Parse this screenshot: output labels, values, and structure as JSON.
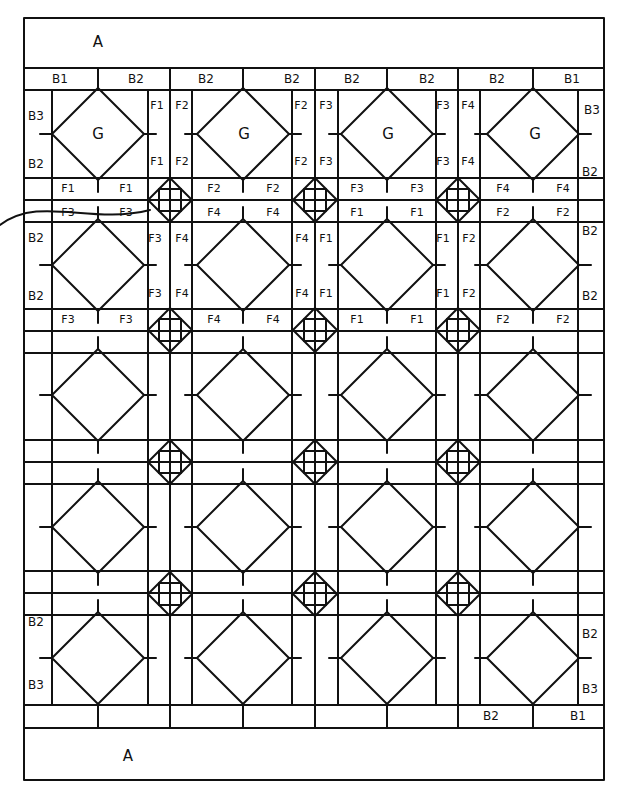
{
  "diagram": {
    "stroke_color": "#111111",
    "background": "#ffffff",
    "outer_border": {
      "x": 24,
      "y": 18,
      "w": 580,
      "h": 762
    },
    "h_lines": [
      18,
      68,
      90,
      178,
      200,
      222,
      309,
      331,
      353,
      440,
      462,
      484,
      571,
      593,
      615,
      705,
      728,
      780
    ],
    "v_lines": [
      24,
      52,
      148,
      170,
      192,
      292,
      315,
      338,
      436,
      458,
      480,
      578,
      604
    ],
    "block_cols_x": [
      98,
      243,
      387,
      533
    ],
    "block_rows_y": [
      134,
      265,
      395,
      527,
      658
    ],
    "block_half": 46,
    "small_sq_cols_x": [
      170,
      315,
      458
    ],
    "small_sq_rows_y": [
      200,
      330,
      462,
      594
    ],
    "small_sq_half": 22
  },
  "labels": {
    "border_top_A": "A",
    "border_bottom_A": "A",
    "top_strip": [
      "B1",
      "B2",
      "B2",
      "B2",
      "B2",
      "B2",
      "B2",
      "B1"
    ],
    "bottom_strip": [
      "B2",
      "B1"
    ],
    "left_side": [
      "B3",
      "B2",
      "B2",
      "B2",
      "B2",
      "B3"
    ],
    "right_side": [
      "B3",
      "B2",
      "B2",
      "B2",
      "B2",
      "B3"
    ],
    "blocks_G": [
      "G",
      "G",
      "G",
      "G"
    ],
    "row1_vertical_pairs_top": [
      "F1",
      "F2",
      "F2",
      "F3",
      "F3",
      "F4"
    ],
    "row1_vertical_pairs_bottom": [
      "F1",
      "F2",
      "F2",
      "F3",
      "F3",
      "F4"
    ],
    "sashing_row1_top": [
      "F1",
      "F1",
      "F2",
      "F2",
      "F3",
      "F3",
      "F4",
      "F4"
    ],
    "sashing_row1_bottom": [
      "F3",
      "F3",
      "F4",
      "F4",
      "F1",
      "F1",
      "F2",
      "F2"
    ],
    "row2_vertical_pairs_top": [
      "F3",
      "F4",
      "F4",
      "F1",
      "F1",
      "F2"
    ],
    "row2_vertical_pairs_bottom": [
      "F3",
      "F4",
      "F4",
      "F1",
      "F1",
      "F2"
    ],
    "sashing_row2": [
      "F3",
      "F3",
      "F4",
      "F4",
      "F1",
      "F1",
      "F2",
      "F2"
    ]
  }
}
